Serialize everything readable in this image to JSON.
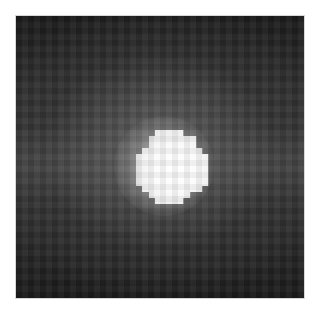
{
  "image": {
    "subject": "bright point source on dark background",
    "description": "Grayscale pixelated image of a bright, roughly circular source centered in frame, surrounded by a diffuse gray halo fading to dark edges",
    "colors": {
      "border": "#ffffff",
      "background_dark": "#1a1a1a",
      "halo_gray": "#5a5a5a",
      "core_white": "#ffffff"
    }
  }
}
